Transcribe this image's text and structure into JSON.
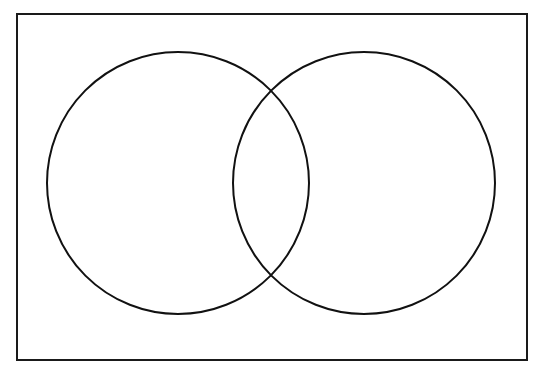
{
  "diagram": {
    "type": "venn",
    "title": "",
    "frame": {
      "x": 17,
      "y": 14,
      "width": 510,
      "height": 346,
      "stroke": "#1a1a1a",
      "stroke_width": 2
    },
    "sets": [
      {
        "id": "A",
        "label": "",
        "cx": 178,
        "cy": 183,
        "r": 131,
        "stroke": "#111111",
        "stroke_width": 2
      },
      {
        "id": "B",
        "label": "",
        "cx": 364,
        "cy": 183,
        "r": 131,
        "stroke": "#111111",
        "stroke_width": 2
      }
    ],
    "background": "#ffffff"
  }
}
